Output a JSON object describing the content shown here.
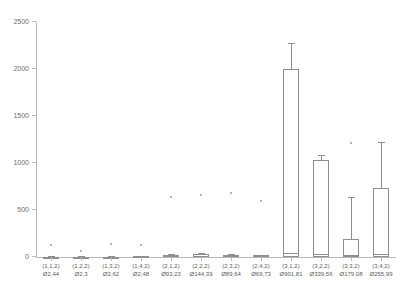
{
  "chart_data": {
    "type": "box",
    "title": "",
    "xlabel": "",
    "ylabel": "",
    "ylim": [
      0,
      2500
    ],
    "yticks": [
      0,
      500,
      1000,
      1500,
      2000,
      2500
    ],
    "grid": false,
    "legend": "none",
    "categories": [
      "(1,1,2)",
      "(1,2,2)",
      "(1,3,2)",
      "(1,4,2)",
      "(2,1,2)",
      "(2,2,2)",
      "(2,3,2)",
      "(2,4,2)",
      "(3,1,2)",
      "(3,2,2)",
      "(3,3,2)",
      "(3,4,2)"
    ],
    "mean_labels": [
      "Ø2,44",
      "Ø2,3",
      "Ø2,62",
      "Ø2,48",
      "Ø93,23",
      "Ø144,39",
      "Ø89,64",
      "Ø69,73",
      "Ø901,81",
      "Ø339,56",
      "Ø179,08",
      "Ø255,99"
    ],
    "means": [
      2.44,
      2.3,
      2.62,
      2.48,
      93.23,
      144.39,
      89.64,
      69.73,
      901.81,
      339.56,
      179.08,
      255.99
    ],
    "boxes": [
      {
        "category": "(1,1,2)",
        "whisker_low": 0,
        "q1": 0,
        "median": 2,
        "q3": 5,
        "whisker_high": 8,
        "outliers": [
          130
        ]
      },
      {
        "category": "(1,2,2)",
        "whisker_low": 0,
        "q1": 0,
        "median": 2,
        "q3": 4,
        "whisker_high": 7,
        "outliers": [
          60
        ]
      },
      {
        "category": "(1,3,2)",
        "whisker_low": 0,
        "q1": 0,
        "median": 2,
        "q3": 5,
        "whisker_high": 9,
        "outliers": [
          135
        ]
      },
      {
        "category": "(1,4,2)",
        "whisker_low": 0,
        "q1": 0,
        "median": 2,
        "q3": 6,
        "whisker_high": 12,
        "outliers": [
          128
        ]
      },
      {
        "category": "(2,1,2)",
        "whisker_low": 0,
        "q1": 2,
        "median": 14,
        "q3": 26,
        "whisker_high": 34,
        "outliers": [
          640
        ]
      },
      {
        "category": "(2,2,2)",
        "whisker_low": 0,
        "q1": 2,
        "median": 16,
        "q3": 30,
        "whisker_high": 40,
        "outliers": [
          655
        ]
      },
      {
        "category": "(2,3,2)",
        "whisker_low": 0,
        "q1": 2,
        "median": 12,
        "q3": 24,
        "whisker_high": 30,
        "outliers": [
          680
        ]
      },
      {
        "category": "(2,4,2)",
        "whisker_low": 0,
        "q1": 1,
        "median": 10,
        "q3": 20,
        "whisker_high": 26,
        "outliers": [
          592
        ]
      },
      {
        "category": "(3,1,2)",
        "whisker_low": 0,
        "q1": 0,
        "median": 40,
        "q3": 2000,
        "whisker_high": 2280,
        "outliers": []
      },
      {
        "category": "(3,2,2)",
        "whisker_low": 0,
        "q1": 0,
        "median": 30,
        "q3": 1035,
        "whisker_high": 1090,
        "outliers": []
      },
      {
        "category": "(3,3,2)",
        "whisker_low": 0,
        "q1": 0,
        "median": 25,
        "q3": 190,
        "whisker_high": 640,
        "outliers": [
          1210
        ]
      },
      {
        "category": "(3,4,2)",
        "whisker_low": 0,
        "q1": 0,
        "median": 35,
        "q3": 730,
        "whisker_high": 1220,
        "outliers": []
      }
    ],
    "colors": {
      "box_stroke": "#8e8e8e",
      "box_fill": "#ffffff",
      "axis": "#b9b9b9",
      "tick_text": "#6e6e6e",
      "label_text": "#5d5d5d",
      "outlier": "#9a9a9a"
    }
  }
}
